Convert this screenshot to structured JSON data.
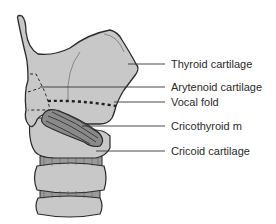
{
  "figure": {
    "labels": [
      {
        "id": "thyroid",
        "text": "Thyroid cartilage"
      },
      {
        "id": "arytenoid",
        "text": "Arytenoid cartilage"
      },
      {
        "id": "vocal_fold",
        "text": "Vocal fold"
      },
      {
        "id": "cricothyroid",
        "text": "Cricothyroid m"
      },
      {
        "id": "cricoid",
        "text": "Cricoid cartilage"
      }
    ],
    "colors": {
      "cartilage_fill": "#c8c8c8",
      "muscle_fill": "#8a8a8a",
      "ring_band_fill": "#9a9a9a",
      "outline": "#2a2a2a",
      "leader_line": "#333333",
      "background": "#ffffff"
    }
  }
}
